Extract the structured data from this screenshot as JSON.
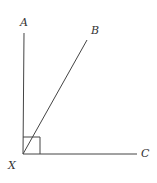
{
  "diagram": {
    "labels": {
      "A": "A",
      "B": "B",
      "C": "C",
      "X": "X"
    },
    "vertex": "X",
    "rays": [
      "XA",
      "XB",
      "XC"
    ],
    "right_angle_at": "X",
    "right_angle_between": [
      "XA",
      "XC"
    ],
    "colors": {
      "line": "#444444",
      "label": "#333333",
      "background": "#ffffff"
    }
  }
}
